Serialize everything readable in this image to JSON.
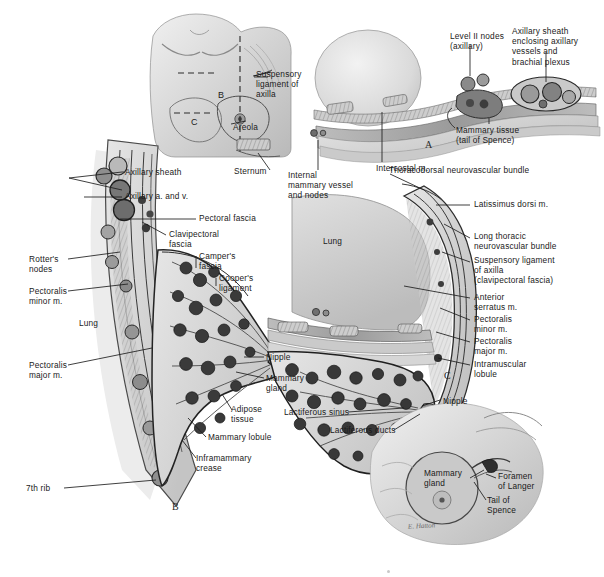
{
  "figure": {
    "panel_letters": [
      {
        "letter": "A",
        "x": 425,
        "y": 139
      },
      {
        "letter": "B",
        "x": 172,
        "y": 501
      },
      {
        "letter": "C",
        "x": 444,
        "y": 370
      }
    ],
    "signature": "E. Hatton"
  },
  "colors": {
    "ink": "#1a1a1a",
    "leader": "#1d1d1d",
    "tissue_light": "#dcdcdc",
    "tissue_mid": "#b4b4b4",
    "tissue_dark": "#7a7a7a",
    "lung": "#cfcfcf",
    "outline": "#2b2b2b",
    "paper": "#ffffff"
  },
  "panel_top_inset": {
    "name": "torso-overview",
    "section_markers": [
      "B",
      "C"
    ],
    "labels": [
      {
        "id": "suspensory-ligament-of-axilla",
        "text": "Suspensory\nligament of\naxilla",
        "x": 256,
        "y": 69
      },
      {
        "id": "areola",
        "text": "Areola",
        "x": 233,
        "y": 122
      }
    ]
  },
  "panel_a": {
    "name": "axilla-cross-section",
    "labels": [
      {
        "id": "level-ii-nodes",
        "text": "Level II nodes\n(axillary)",
        "x": 450,
        "y": 31
      },
      {
        "id": "axillary-sheath-enclosing",
        "text": "Axillary sheath\nenclosing axillary\nvessels and\nbrachial plexus",
        "x": 512,
        "y": 26
      },
      {
        "id": "mammary-tissue-tail-of-spence",
        "text": "Mammary tissue\n(tail of Spence)",
        "x": 456,
        "y": 125
      },
      {
        "id": "intercostal-m",
        "text": "Intercostal m.",
        "x": 376,
        "y": 163
      },
      {
        "id": "sternum",
        "text": "Sternum",
        "x": 234,
        "y": 172
      },
      {
        "id": "internal-mammary-vessel-and-nodes",
        "text": "Internal\nmammary vessel\nand nodes",
        "x": 288,
        "y": 175
      }
    ]
  },
  "panel_b": {
    "name": "sagittal-breast-section",
    "labels": [
      {
        "id": "axillary-sheath",
        "text": "Axillary sheath",
        "x": 125,
        "y": 169
      },
      {
        "id": "axillary-a-and-v",
        "text": "Axillary a. and v.",
        "x": 125,
        "y": 194
      },
      {
        "id": "clavipectoral-fascia",
        "text": "Clavipectoral\nfascia",
        "x": 169,
        "y": 230
      },
      {
        "id": "pectoral-fascia",
        "text": "Pectoral fascia",
        "x": 199,
        "y": 216
      },
      {
        "id": "campers-fascia",
        "text": "Camper's\nfascia",
        "x": 199,
        "y": 252
      },
      {
        "id": "coopers-ligament",
        "text": "Cooper's\nligament",
        "x": 219,
        "y": 274
      },
      {
        "id": "rotters-nodes",
        "text": "Rotter's\nnodes",
        "x": 29,
        "y": 256
      },
      {
        "id": "pectoralis-minor-m",
        "text": "Pectoralis\nminor m.",
        "x": 29,
        "y": 288
      },
      {
        "id": "lung",
        "text": "Lung",
        "x": 79,
        "y": 321
      },
      {
        "id": "pectoralis-major-m",
        "text": "Pectoralis\nmajor m.",
        "x": 29,
        "y": 362
      },
      {
        "id": "nipple",
        "text": "Nipple",
        "x": 266,
        "y": 354
      },
      {
        "id": "mammary-gland",
        "text": "Mammary\ngland",
        "x": 266,
        "y": 375
      },
      {
        "id": "adipose-tissue",
        "text": "Adipose\ntissue",
        "x": 231,
        "y": 406
      },
      {
        "id": "mammary-lobule",
        "text": "Mammary lobule",
        "x": 208,
        "y": 434
      },
      {
        "id": "inframammary-crease",
        "text": "Inframammary\ncrease",
        "x": 196,
        "y": 455
      },
      {
        "id": "seventh-rib",
        "text": "7th rib",
        "x": 26,
        "y": 485
      }
    ]
  },
  "panel_c": {
    "name": "lateral-breast-section",
    "labels": [
      {
        "id": "thoracodorsal-neurovascular-bundle",
        "text": "Thoracodorsal neurovascular bundle",
        "x": 389,
        "y": 167
      },
      {
        "id": "latissimus-dorsi-m",
        "text": "Latissimus dorsi m.",
        "x": 474,
        "y": 202
      },
      {
        "id": "lung-c",
        "text": "Lung",
        "x": 323,
        "y": 239
      },
      {
        "id": "long-thoracic-neurovascular-bundle",
        "text": "Long thoracic\nneurovascular bundle",
        "x": 474,
        "y": 233
      },
      {
        "id": "suspensory-ligament-of-axilla-c",
        "text": "Suspensory ligament\nof axilla\n(clavipectoral fascia)",
        "x": 474,
        "y": 258
      },
      {
        "id": "anterior-serratus-m",
        "text": "Anterior\nserratus m.",
        "x": 474,
        "y": 294
      },
      {
        "id": "pectoralis-minor-m-c",
        "text": "Pectoralis\nminor m.",
        "x": 474,
        "y": 316
      },
      {
        "id": "pectoralis-major-m-c",
        "text": "Pectoralis\nmajor m.",
        "x": 474,
        "y": 338
      },
      {
        "id": "intramuscular-lobule",
        "text": "Intramuscular\nlobule",
        "x": 474,
        "y": 361
      },
      {
        "id": "nipple-c",
        "text": "Nipple",
        "x": 443,
        "y": 398
      },
      {
        "id": "lactiferous-sinus",
        "text": "Lactiferous sinus",
        "x": 290,
        "y": 409
      },
      {
        "id": "lactiferous-ducts",
        "text": "Lactiferous ducts",
        "x": 334,
        "y": 428
      }
    ]
  },
  "panel_d_inset": {
    "name": "surface-anatomy-inset",
    "labels": [
      {
        "id": "mammary-gland-inset",
        "text": "Mammary\ngland",
        "x": 424,
        "y": 470
      },
      {
        "id": "foramen-of-langer",
        "text": "Foramen\nof Langer",
        "x": 498,
        "y": 473
      },
      {
        "id": "tail-of-spence",
        "text": "Tail of\nSpence",
        "x": 487,
        "y": 497
      }
    ]
  }
}
